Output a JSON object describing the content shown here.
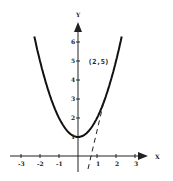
{
  "chart_data": {
    "type": "line",
    "title": "",
    "xlabel": "X",
    "ylabel": "Y",
    "xlim": [
      -3.5,
      3.5
    ],
    "ylim": [
      0,
      6.5
    ],
    "grid": false,
    "x_ticks": [
      "-3",
      "-2",
      "-1",
      "1",
      "2",
      "3"
    ],
    "y_ticks": [
      "1",
      "2",
      "3",
      "4",
      "5",
      "6"
    ],
    "series": [
      {
        "name": "y = x^2 + 1",
        "style": "solid",
        "equation": "x^2+1",
        "x_range": [
          -2.3,
          2.3
        ]
      },
      {
        "name": "tangent y = 4x - 3",
        "style": "dashed",
        "equation": "4x-3",
        "x_range": [
          0.5,
          1.5
        ]
      }
    ],
    "annotations": [
      {
        "text": "(2,5)",
        "x": 2,
        "y": 5
      }
    ]
  },
  "labels": {
    "x_axis": "X",
    "y_axis": "Y",
    "point": "(2,5)",
    "xt": [
      "-3",
      "-2",
      "-1",
      "1",
      "2",
      "3"
    ],
    "yt": [
      "1",
      "2",
      "3",
      "4",
      "5",
      "6"
    ]
  }
}
